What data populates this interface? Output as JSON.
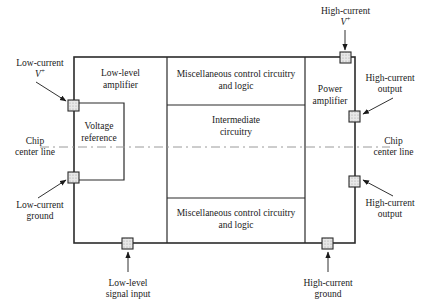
{
  "figure": {
    "type": "chip-floorplan-diagram",
    "colors": {
      "outline": "#2b2b2b",
      "centerline": "#8a8a8a",
      "pad_fill": "#e3e3e3",
      "background": "#ffffff",
      "text": "#1a1a1a"
    }
  },
  "blocks": [
    {
      "id": "low-level-amplifier",
      "label": "Low-level\namplifier",
      "line1": "Low-level",
      "line2": "amplifier"
    },
    {
      "id": "voltage-reference",
      "label": "Voltage\nreference",
      "line1": "Voltage",
      "line2": "reference"
    },
    {
      "id": "misc-control-top",
      "label": "Miscellaneous control circuitry\nand logic",
      "line1": "Miscellaneous control circuitry",
      "line2": "and logic"
    },
    {
      "id": "intermediate-circuitry",
      "label": "Intermediate\ncircuitry",
      "line1": "Intermediate",
      "line2": "circuitry"
    },
    {
      "id": "misc-control-bottom",
      "label": "Miscellaneous control circuitry\nand logic",
      "line1": "Miscellaneous control circuitry",
      "line2": "and logic"
    },
    {
      "id": "power-amplifier",
      "label": "Power\namplifier",
      "line1": "Power",
      "line2": "amplifier"
    }
  ],
  "pads": [
    {
      "id": "pad-low-current-vplus",
      "side": "left",
      "label_line1": "Low-current",
      "label_line2": "V+"
    },
    {
      "id": "pad-low-current-ground",
      "side": "left",
      "label_line1": "Low-current",
      "label_line2": "ground"
    },
    {
      "id": "pad-high-current-vplus",
      "side": "top",
      "label_line1": "High-current",
      "label_line2": "V+"
    },
    {
      "id": "pad-high-current-output-upper",
      "side": "right",
      "label_line1": "High-current",
      "label_line2": "output"
    },
    {
      "id": "pad-high-current-output-lower",
      "side": "right",
      "label_line1": "High-current",
      "label_line2": "output"
    },
    {
      "id": "pad-low-level-signal-input",
      "side": "bottom",
      "label_line1": "Low-level",
      "label_line2": "signal input"
    },
    {
      "id": "pad-high-current-ground",
      "side": "bottom",
      "label_line1": "High-current",
      "label_line2": "ground"
    }
  ],
  "labels": {
    "low_current_vplus_l1": "Low-current",
    "low_current_vplus_v": "V",
    "low_current_vplus_sup": "+",
    "low_current_ground_l1": "Low-current",
    "low_current_ground_l2": "ground",
    "high_current_vplus_l1": "High-current",
    "high_current_vplus_v": "V",
    "high_current_vplus_sup": "+",
    "high_current_output_upper_l1": "High-current",
    "high_current_output_upper_l2": "output",
    "high_current_output_lower_l1": "High-current",
    "high_current_output_lower_l2": "output",
    "low_level_signal_input_l1": "Low-level",
    "low_level_signal_input_l2": "signal input",
    "high_current_ground_l1": "High-current",
    "high_current_ground_l2": "ground",
    "chip_center_line_left_l1": "Chip",
    "chip_center_line_left_l2": "center line",
    "chip_center_line_right_l1": "Chip",
    "chip_center_line_right_l2": "center line"
  }
}
